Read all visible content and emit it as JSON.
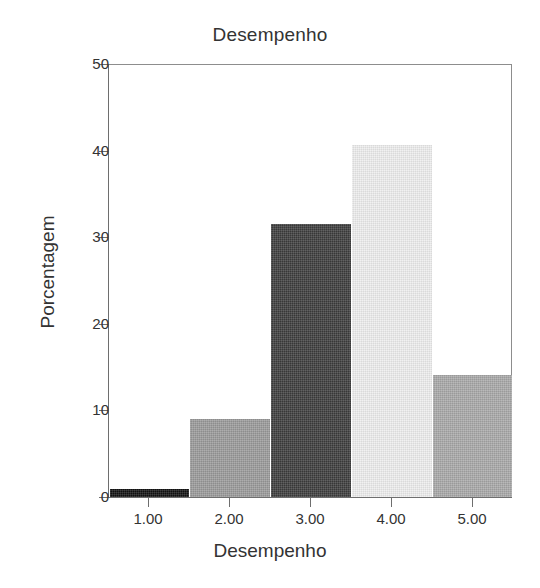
{
  "chart_data": {
    "type": "bar",
    "title": "Desempenho",
    "xlabel": "Desempenho",
    "ylabel": "Porcentagem",
    "categories": [
      "1.00",
      "2.00",
      "3.00",
      "4.00",
      "5.00"
    ],
    "values": [
      0.9,
      9.0,
      31.5,
      40.7,
      14.1
    ],
    "ylim": [
      0,
      50
    ],
    "yticks": [
      "0",
      "10",
      "20",
      "30",
      "40",
      "50"
    ],
    "ytick_values": [
      0,
      10,
      20,
      30,
      40,
      50
    ],
    "grid": false,
    "legend": null,
    "bar_colors": [
      "#121212",
      "#9a9a9a",
      "#3c3c3c",
      "#eeeeee",
      "#a8a8a8"
    ],
    "axis_color": "#6e6e6e",
    "text_color": "#333333",
    "background": "#ffffff"
  }
}
